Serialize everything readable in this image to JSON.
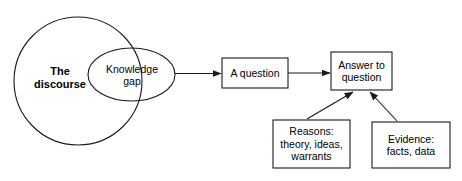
{
  "diagram": {
    "type": "flow-diagram",
    "title": "",
    "background_color": "#ffffff",
    "stroke_color": "#1a1a1a",
    "text_color": "#000000",
    "shapes": {
      "discourse_circle": {
        "label_lines": [
          "The",
          "discourse"
        ],
        "shape": "circle",
        "bold": true
      },
      "knowledge_gap_ellipse": {
        "label_lines": [
          "Knowledge",
          "gap"
        ],
        "shape": "ellipse",
        "bold": false
      },
      "a_question_box": {
        "label_lines": [
          "A question"
        ],
        "shape": "rectangle"
      },
      "answer_box": {
        "label_lines": [
          "Answer to",
          "question"
        ],
        "shape": "rectangle"
      },
      "reasons_box": {
        "label_lines": [
          "Reasons:",
          "theory, ideas,",
          "warrants"
        ],
        "shape": "rectangle"
      },
      "evidence_box": {
        "label_lines": [
          "Evidence:",
          "facts, data"
        ],
        "shape": "rectangle"
      }
    },
    "connectors": [
      {
        "name": "gap-to-question",
        "from": "knowledge_gap_ellipse",
        "to": "a_question_box",
        "style": "arrow",
        "direction": "right"
      },
      {
        "name": "question-to-answer",
        "from": "a_question_box",
        "to": "answer_box",
        "style": "arrow",
        "direction": "right"
      },
      {
        "name": "reasons-to-answer",
        "from": "reasons_box",
        "to": "answer_box",
        "style": "arrow",
        "direction": "up-right"
      },
      {
        "name": "evidence-to-answer",
        "from": "evidence_box",
        "to": "answer_box",
        "style": "arrow",
        "direction": "up-left"
      }
    ]
  }
}
